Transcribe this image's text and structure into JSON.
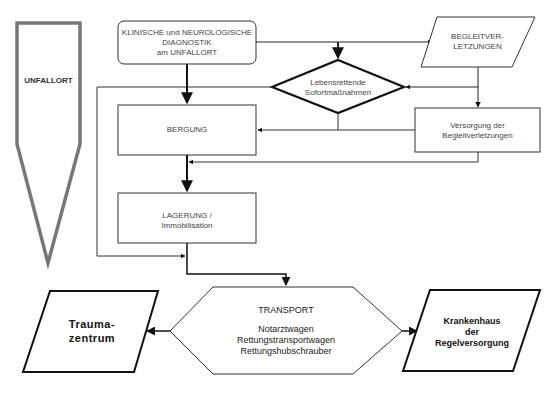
{
  "diagram": {
    "title": "",
    "nodes": {
      "unfallort": {
        "label": "UNFALLORT"
      },
      "diagnostik": {
        "line1": "KLINISCHE und NEUROLOGISCHE",
        "line2": "DIAGNOSTIK",
        "line3": "am UNFALLORT"
      },
      "begleitverletzungen": {
        "line1": "BEGLEITVER-",
        "line2": "LETZUNGEN"
      },
      "sofortmassnahmen": {
        "line1": "Lebensrettende",
        "line2": "Sofortmaßnahmen"
      },
      "bergung": {
        "label": "BERGUNG"
      },
      "versorgung": {
        "line1": "Versorgung der",
        "line2": "Begleitverletzungen"
      },
      "lagerung": {
        "line1": "LAGERUNG /",
        "line2": "Immobilisation"
      },
      "transport": {
        "title": "TRANSPORT",
        "line1": "Notarztwagen",
        "line2": "Rettungstransportwagen",
        "line3": "Rettungshubschrauber"
      },
      "traumazentrum": {
        "line1": "Trauma-",
        "line2": "zentrum"
      },
      "krankenhaus": {
        "line1": "Krankenhaus",
        "line2": "der",
        "line3": "Regelversorgung"
      }
    },
    "colors": {
      "line": "#222222",
      "text": "#444444",
      "unfallort_border": "#777777"
    }
  }
}
